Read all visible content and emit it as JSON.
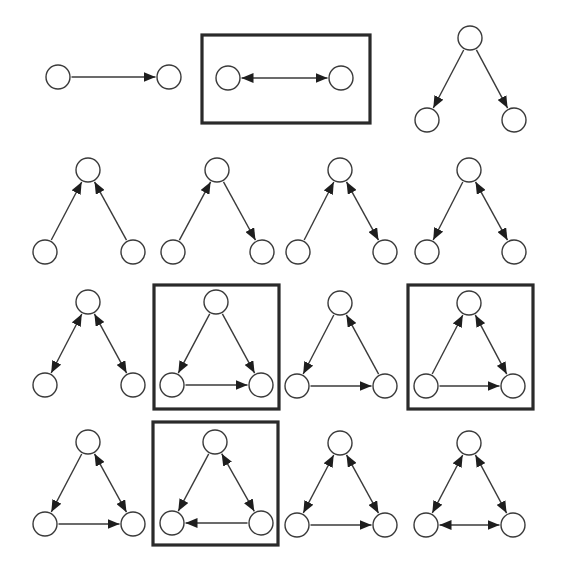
{
  "figure": {
    "colors": {
      "stroke": "#3a3a3a",
      "arrow": "#1e1e1e",
      "box": "#2a2a2a",
      "background": "#ffffff"
    },
    "node_radius": 12,
    "motifs": [
      {
        "id": "m1",
        "row": 1,
        "col": 1,
        "highlighted": false,
        "nodes": [
          [
            58,
            77
          ],
          [
            169,
            77
          ]
        ],
        "edges": [
          {
            "from": 0,
            "to": 1,
            "bidirectional": false
          }
        ]
      },
      {
        "id": "m2",
        "row": 1,
        "col": 2,
        "highlighted": true,
        "box": [
          202,
          35,
          168,
          88
        ],
        "nodes": [
          [
            228,
            78
          ],
          [
            341,
            78
          ]
        ],
        "edges": [
          {
            "from": 0,
            "to": 1,
            "bidirectional": true
          }
        ]
      },
      {
        "id": "m3",
        "row": 1,
        "col": 3,
        "highlighted": false,
        "nodes": [
          [
            470,
            38
          ],
          [
            427,
            120
          ],
          [
            514,
            120
          ]
        ],
        "edges": [
          {
            "from": 0,
            "to": 1,
            "bidirectional": false
          },
          {
            "from": 0,
            "to": 2,
            "bidirectional": false
          }
        ]
      },
      {
        "id": "m4",
        "row": 2,
        "col": 1,
        "highlighted": false,
        "nodes": [
          [
            88,
            170
          ],
          [
            45,
            252
          ],
          [
            133,
            252
          ]
        ],
        "edges": [
          {
            "from": 1,
            "to": 0,
            "bidirectional": false
          },
          {
            "from": 2,
            "to": 0,
            "bidirectional": false
          }
        ]
      },
      {
        "id": "m5",
        "row": 2,
        "col": 2,
        "highlighted": false,
        "nodes": [
          [
            217,
            170
          ],
          [
            173,
            252
          ],
          [
            262,
            252
          ]
        ],
        "edges": [
          {
            "from": 1,
            "to": 0,
            "bidirectional": false
          },
          {
            "from": 0,
            "to": 2,
            "bidirectional": false
          }
        ]
      },
      {
        "id": "m6",
        "row": 2,
        "col": 3,
        "highlighted": false,
        "nodes": [
          [
            340,
            170
          ],
          [
            298,
            252
          ],
          [
            385,
            252
          ]
        ],
        "edges": [
          {
            "from": 1,
            "to": 0,
            "bidirectional": false
          },
          {
            "from": 0,
            "to": 2,
            "bidirectional": true
          }
        ]
      },
      {
        "id": "m7",
        "row": 2,
        "col": 4,
        "highlighted": false,
        "nodes": [
          [
            469,
            170
          ],
          [
            427,
            252
          ],
          [
            514,
            252
          ]
        ],
        "edges": [
          {
            "from": 0,
            "to": 1,
            "bidirectional": false
          },
          {
            "from": 0,
            "to": 2,
            "bidirectional": true
          }
        ]
      },
      {
        "id": "m8",
        "row": 3,
        "col": 1,
        "highlighted": false,
        "nodes": [
          [
            88,
            302
          ],
          [
            45,
            385
          ],
          [
            133,
            385
          ]
        ],
        "edges": [
          {
            "from": 0,
            "to": 1,
            "bidirectional": true
          },
          {
            "from": 0,
            "to": 2,
            "bidirectional": true
          }
        ]
      },
      {
        "id": "m9",
        "row": 3,
        "col": 2,
        "highlighted": true,
        "box": [
          154,
          285,
          125,
          124
        ],
        "nodes": [
          [
            216,
            302
          ],
          [
            172,
            385
          ],
          [
            261,
            385
          ]
        ],
        "edges": [
          {
            "from": 0,
            "to": 1,
            "bidirectional": false
          },
          {
            "from": 0,
            "to": 2,
            "bidirectional": false
          },
          {
            "from": 1,
            "to": 2,
            "bidirectional": false
          }
        ]
      },
      {
        "id": "m10",
        "row": 3,
        "col": 3,
        "highlighted": false,
        "nodes": [
          [
            340,
            303
          ],
          [
            297,
            386
          ],
          [
            385,
            386
          ]
        ],
        "edges": [
          {
            "from": 0,
            "to": 1,
            "bidirectional": false
          },
          {
            "from": 1,
            "to": 2,
            "bidirectional": false
          },
          {
            "from": 2,
            "to": 0,
            "bidirectional": false
          }
        ]
      },
      {
        "id": "m11",
        "row": 3,
        "col": 4,
        "highlighted": true,
        "box": [
          408,
          285,
          125,
          124
        ],
        "nodes": [
          [
            469,
            303
          ],
          [
            426,
            386
          ],
          [
            513,
            386
          ]
        ],
        "edges": [
          {
            "from": 1,
            "to": 0,
            "bidirectional": false
          },
          {
            "from": 0,
            "to": 2,
            "bidirectional": true
          },
          {
            "from": 1,
            "to": 2,
            "bidirectional": false
          }
        ]
      },
      {
        "id": "m12",
        "row": 4,
        "col": 1,
        "highlighted": false,
        "nodes": [
          [
            88,
            442
          ],
          [
            45,
            524
          ],
          [
            133,
            524
          ]
        ],
        "edges": [
          {
            "from": 0,
            "to": 1,
            "bidirectional": false
          },
          {
            "from": 0,
            "to": 2,
            "bidirectional": true
          },
          {
            "from": 1,
            "to": 2,
            "bidirectional": false
          }
        ]
      },
      {
        "id": "m13",
        "row": 4,
        "col": 2,
        "highlighted": true,
        "box": [
          153,
          422,
          125,
          123
        ],
        "nodes": [
          [
            215,
            442
          ],
          [
            172,
            523
          ],
          [
            261,
            523
          ]
        ],
        "edges": [
          {
            "from": 0,
            "to": 1,
            "bidirectional": false
          },
          {
            "from": 0,
            "to": 2,
            "bidirectional": true
          },
          {
            "from": 2,
            "to": 1,
            "bidirectional": false
          }
        ]
      },
      {
        "id": "m14",
        "row": 4,
        "col": 3,
        "highlighted": false,
        "nodes": [
          [
            340,
            443
          ],
          [
            297,
            525
          ],
          [
            385,
            525
          ]
        ],
        "edges": [
          {
            "from": 0,
            "to": 1,
            "bidirectional": true
          },
          {
            "from": 0,
            "to": 2,
            "bidirectional": true
          },
          {
            "from": 1,
            "to": 2,
            "bidirectional": false
          }
        ]
      },
      {
        "id": "m15",
        "row": 4,
        "col": 4,
        "highlighted": false,
        "nodes": [
          [
            469,
            443
          ],
          [
            426,
            525
          ],
          [
            513,
            525
          ]
        ],
        "edges": [
          {
            "from": 0,
            "to": 1,
            "bidirectional": true
          },
          {
            "from": 0,
            "to": 2,
            "bidirectional": true
          },
          {
            "from": 1,
            "to": 2,
            "bidirectional": true
          }
        ]
      }
    ]
  }
}
